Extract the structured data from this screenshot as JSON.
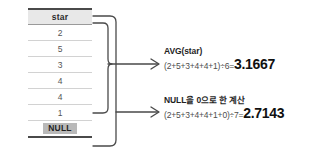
{
  "diagram": {
    "type": "sql-aggregate-null-explanation",
    "language": "ko"
  },
  "table": {
    "column_header": "star",
    "rows": [
      {
        "value": "2",
        "is_null": false
      },
      {
        "value": "5",
        "is_null": false
      },
      {
        "value": "3",
        "is_null": false
      },
      {
        "value": "4",
        "is_null": false
      },
      {
        "value": "4",
        "is_null": false
      },
      {
        "value": "1",
        "is_null": false
      },
      {
        "value": "NULL",
        "is_null": true
      }
    ]
  },
  "brackets": {
    "inner_label": "non-null-rows-bracket",
    "outer_label": "all-rows-bracket"
  },
  "calculations": [
    {
      "title": "AVG(star)",
      "expression": "(2+5+3+4+4+1)÷6=",
      "result": "3.1667"
    },
    {
      "title": "NULL을 0으로 한 계산",
      "expression": "(2+5+3+4+4+1+0)÷7=",
      "result": "2.7143"
    }
  ],
  "colors": {
    "line": "#4a4a4a",
    "header_bg": "#e8e8e8",
    "null_chip_bg": "#b9b9b9",
    "row_divider": "#d2d2d2",
    "result_text": "#111111",
    "expr_text": "#4d4d4d"
  }
}
